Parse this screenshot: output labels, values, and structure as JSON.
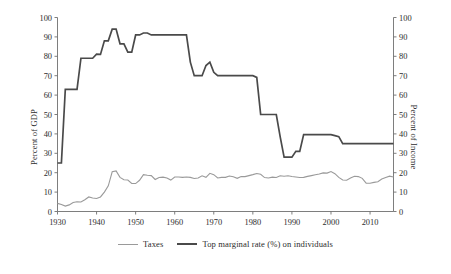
{
  "chart_data": {
    "type": "line",
    "title": "",
    "xlabel": "",
    "ylabel": "Percent of GDP",
    "y2label": "Percent of Income",
    "xlim": [
      1930,
      2016
    ],
    "ylim": [
      0,
      100
    ],
    "y2lim": [
      0,
      100
    ],
    "grid": false,
    "legend_position": "bottom-center",
    "xticks": [
      1930,
      1940,
      1950,
      1960,
      1970,
      1980,
      1990,
      2000,
      2010
    ],
    "xtick_labels": [
      "1930",
      "1940",
      "1950",
      "1960",
      "1970",
      "1980",
      "1990",
      "2000",
      "2010"
    ],
    "yticks": [
      0,
      10,
      20,
      30,
      40,
      50,
      60,
      70,
      80,
      90,
      100
    ],
    "ytick_labels": [
      "0",
      "10",
      "20",
      "30",
      "40",
      "50",
      "60",
      "70",
      "80",
      "90",
      "100"
    ],
    "y2ticks": [
      0,
      10,
      20,
      30,
      40,
      50,
      60,
      70,
      80,
      90,
      100
    ],
    "y2tick_labels": [
      "0",
      "10",
      "20",
      "30",
      "40",
      "50",
      "60",
      "70",
      "80",
      "90",
      "100"
    ],
    "x": [
      1930,
      1931,
      1932,
      1933,
      1934,
      1935,
      1936,
      1937,
      1938,
      1939,
      1940,
      1941,
      1942,
      1943,
      1944,
      1945,
      1946,
      1947,
      1948,
      1949,
      1950,
      1951,
      1952,
      1953,
      1954,
      1955,
      1956,
      1957,
      1958,
      1959,
      1960,
      1961,
      1962,
      1963,
      1964,
      1965,
      1966,
      1967,
      1968,
      1969,
      1970,
      1971,
      1972,
      1973,
      1974,
      1975,
      1976,
      1977,
      1978,
      1979,
      1980,
      1981,
      1982,
      1983,
      1984,
      1985,
      1986,
      1987,
      1988,
      1989,
      1990,
      1991,
      1992,
      1993,
      1994,
      1995,
      1996,
      1997,
      1998,
      1999,
      2000,
      2001,
      2002,
      2003,
      2004,
      2005,
      2006,
      2007,
      2008,
      2009,
      2010,
      2011,
      2012,
      2013,
      2014,
      2015,
      2016
    ],
    "series": [
      {
        "name": "Taxes",
        "axis": "left",
        "color": "#9a9a9a",
        "width": 1.1,
        "values": [
          4.2,
          3.6,
          2.8,
          3.4,
          4.6,
          5.0,
          4.9,
          6.1,
          7.5,
          7.0,
          6.7,
          7.5,
          10.0,
          13.2,
          20.5,
          20.9,
          17.6,
          16.4,
          16.2,
          14.5,
          14.4,
          16.1,
          19.0,
          18.7,
          18.5,
          16.5,
          17.5,
          17.7,
          17.3,
          16.2,
          17.8,
          17.8,
          17.6,
          17.8,
          17.6,
          17.0,
          17.3,
          18.4,
          17.6,
          19.7,
          19.0,
          17.3,
          17.6,
          17.6,
          18.3,
          17.9,
          17.1,
          18.0,
          18.0,
          18.5,
          19.0,
          19.6,
          19.2,
          17.5,
          17.3,
          17.7,
          17.5,
          18.4,
          18.2,
          18.4,
          18.0,
          17.8,
          17.5,
          17.6,
          18.1,
          18.5,
          18.9,
          19.3,
          19.9,
          19.8,
          20.6,
          19.5,
          17.6,
          16.2,
          16.1,
          17.3,
          18.2,
          18.0,
          17.1,
          14.6,
          14.6,
          15.0,
          15.3,
          16.7,
          17.5,
          18.2,
          17.8
        ]
      },
      {
        "name": "Top marginal rate (%) on individuals",
        "axis": "right",
        "color": "#4a4a4a",
        "width": 1.7,
        "values": [
          25,
          25,
          63,
          63,
          63,
          63,
          79,
          79,
          79,
          79,
          81.1,
          81,
          88,
          88,
          94,
          94,
          86.45,
          86.45,
          82.13,
          82.13,
          91,
          91,
          92,
          92,
          91,
          91,
          91,
          91,
          91,
          91,
          91,
          91,
          91,
          91,
          77,
          70,
          70,
          70,
          75.25,
          77,
          71.75,
          70,
          70,
          70,
          70,
          70,
          70,
          70,
          70,
          70,
          70,
          69.125,
          50,
          50,
          50,
          50,
          50,
          38.5,
          28,
          28,
          28,
          31,
          31,
          39.6,
          39.6,
          39.6,
          39.6,
          39.6,
          39.6,
          39.6,
          39.6,
          39.1,
          38.6,
          35,
          35,
          35,
          35,
          35,
          35,
          35,
          35,
          35,
          35,
          35,
          35,
          35,
          35
        ]
      }
    ]
  },
  "legend": {
    "entries": [
      {
        "label": "Taxes",
        "color": "#9a9a9a",
        "width": "1.2px"
      },
      {
        "label": "Top marginal rate (%) on individuals",
        "color": "#4a4a4a",
        "width": "2px"
      }
    ]
  },
  "axes": {
    "left_title": "Percent of GDP",
    "right_title": "Percent of Income"
  }
}
